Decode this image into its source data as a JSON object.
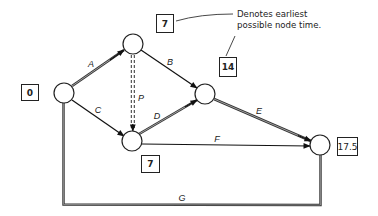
{
  "diagram": {
    "type": "activity-on-arrow network",
    "annotation": {
      "line1": "Denotes earliest",
      "line2": "possible node time."
    },
    "nodes": [
      {
        "id": "n1",
        "earliest_time": "0"
      },
      {
        "id": "n2",
        "earliest_time": "7"
      },
      {
        "id": "n3",
        "earliest_time": "14"
      },
      {
        "id": "n4",
        "earliest_time": "7"
      },
      {
        "id": "n5",
        "earliest_time": "17.5"
      }
    ],
    "activities": [
      {
        "label": "A",
        "from": "n1",
        "to": "n2",
        "style": "double"
      },
      {
        "label": "B",
        "from": "n2",
        "to": "n3",
        "style": "single"
      },
      {
        "label": "C",
        "from": "n1",
        "to": "n4",
        "style": "single"
      },
      {
        "label": "P",
        "from": "n2",
        "to": "n4",
        "style": "double-dashed"
      },
      {
        "label": "D",
        "from": "n4",
        "to": "n3",
        "style": "double"
      },
      {
        "label": "E",
        "from": "n3",
        "to": "n5",
        "style": "double"
      },
      {
        "label": "F",
        "from": "n4",
        "to": "n5",
        "style": "single"
      },
      {
        "label": "G",
        "from": "n1",
        "to": "n5",
        "style": "double"
      }
    ]
  }
}
